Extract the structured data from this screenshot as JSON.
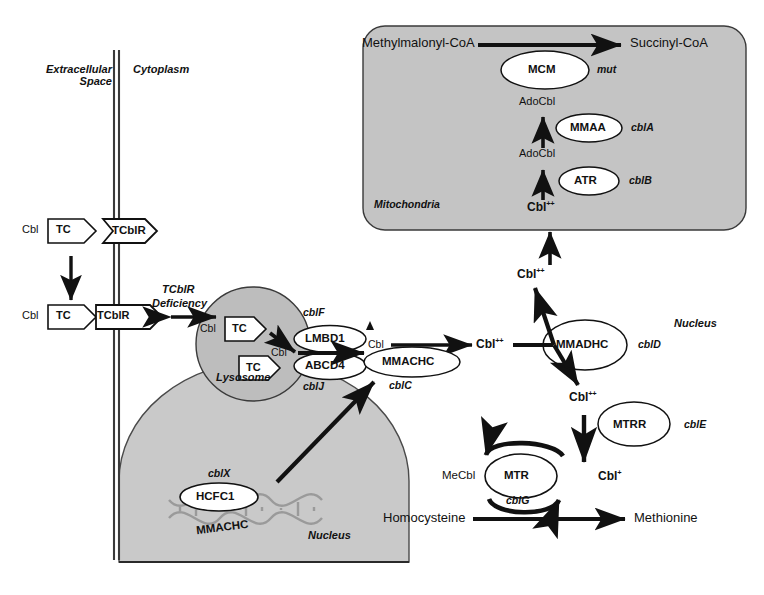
{
  "figure": {
    "compartments": {
      "extracellular": "Extracellular\nSpace",
      "extracellular_line1": "Extracellular",
      "extracellular_line2": "Space",
      "cytoplasm": "Cytoplasm",
      "mitochondria": "Mitochondria",
      "lysosome": "Lysosome",
      "nucleus_organelle": "Nucleus",
      "nucleus_right": "Nucleus"
    },
    "colors": {
      "organelle_fill": "#c4c4c4",
      "organelle_stroke": "#3a3a3a",
      "stroke": "#111111",
      "background": "#ffffff",
      "dna_gray": "#9a9a9a"
    },
    "membrane_transport": {
      "cbl_out": "Cbl",
      "tc_out": "TC",
      "receptor_top": "TCblR",
      "cbl_in": "Cbl",
      "tc_in": "TC",
      "receptor_bottom": "TCblR",
      "deficiency_line1": "TCblR",
      "deficiency_line2": "Deficiency"
    },
    "lysosome_contents": {
      "cbl_entry": "Cbl",
      "tc_bound": "TC",
      "tc_free": "TC",
      "cbl_released": "Cbl",
      "transporter_upper": "LMBD1",
      "transporter_lower": "ABCD4",
      "gene_upper": "cblF",
      "gene_lower": "cblJ"
    },
    "cytoplasm_processing": {
      "cbl_free": "Cbl",
      "mmachc_enzyme": "MMACHC",
      "mmachc_gene": "cblC",
      "cbl_2plus": "Cbl",
      "cbl_2plus_sup": "++"
    },
    "nucleus_contents": {
      "hcfc1": "HCFC1",
      "hcfc1_gene": "cblX",
      "dna_gene": "MMACHC"
    },
    "branch": {
      "mmadhc_enzyme": "MMADHC",
      "mmadhc_gene": "cblD",
      "cbl_up": "Cbl",
      "cbl_up_sup": "++",
      "cbl_down": "Cbl",
      "cbl_down_sup": "++",
      "cbl_to_mito": "Cbl",
      "cbl_to_mito_sup": "++"
    },
    "mitochondria_contents": {
      "substrate": "Methylmalonyl-CoA",
      "product": "Succinyl-CoA",
      "mcm_enzyme": "MCM",
      "mcm_gene": "mut",
      "adocbl_upper": "AdoCbl",
      "mmaa_enzyme": "MMAA",
      "mmaa_gene": "cblA",
      "adocbl_lower": "AdoCbl",
      "atr_enzyme": "ATR",
      "atr_gene": "cblB",
      "cbl_entry": "Cbl",
      "cbl_entry_sup": "++"
    },
    "methionine_cycle": {
      "mtrr_enzyme": "MTRR",
      "mtrr_gene": "cblE",
      "cbl_1plus": "Cbl",
      "cbl_1plus_sup": "+",
      "mecbl": "MeCbl",
      "mtr_enzyme": "MTR",
      "mtr_gene": "cblG",
      "homocysteine": "Homocysteine",
      "methionine": "Methionine"
    }
  }
}
